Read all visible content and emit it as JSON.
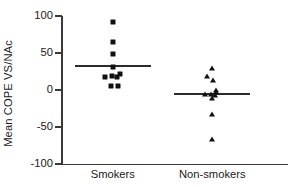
{
  "chart_data": {
    "type": "scatter",
    "title": "",
    "subtitle": "",
    "xlabel": "",
    "ylabel": "Mean COPE VS/NAc",
    "categories": [
      "Smokers",
      "Non-smokers"
    ],
    "ylim": [
      -100,
      100
    ],
    "yticks": [
      100,
      50,
      0,
      -50,
      -100
    ],
    "ytick_labels": [
      "100",
      "50",
      "0",
      "-50",
      "-100"
    ],
    "grid": false,
    "legend": null,
    "legend_position": "none",
    "annotations": [],
    "series": [
      {
        "name": "Smokers",
        "marker": "square",
        "color": "#111111",
        "x_center_frac": 0.225,
        "mean": 33,
        "mean_bar_label": "Smokers mean line",
        "points": [
          {
            "value": 92,
            "offset": 0
          },
          {
            "value": 65,
            "offset": 0
          },
          {
            "value": 48,
            "offset": 0
          },
          {
            "value": 31,
            "offset": 0
          },
          {
            "value": 22,
            "offset": 7
          },
          {
            "value": 19,
            "offset": -1
          },
          {
            "value": 18,
            "offset": -8
          },
          {
            "value": 17,
            "offset": 4
          },
          {
            "value": 6,
            "offset": -2
          },
          {
            "value": 6,
            "offset": 5
          }
        ]
      },
      {
        "name": "Non-smokers",
        "marker": "triangle",
        "color": "#111111",
        "x_center_frac": 0.665,
        "mean": -6,
        "mean_bar_label": "Non-smokers mean line",
        "points": [
          {
            "value": 30,
            "offset": 0
          },
          {
            "value": 19,
            "offset": -5
          },
          {
            "value": 14,
            "offset": 1
          },
          {
            "value": 0,
            "offset": 4
          },
          {
            "value": -3,
            "offset": 4
          },
          {
            "value": -5,
            "offset": -1
          },
          {
            "value": -6,
            "offset": -7
          },
          {
            "value": -7,
            "offset": 3
          },
          {
            "value": -11,
            "offset": 0
          },
          {
            "value": -32,
            "offset": 0
          },
          {
            "value": -66,
            "offset": 0
          }
        ]
      }
    ]
  },
  "axis": {
    "y_label": "Mean COPE VS/NAc",
    "y_ticks": [
      "100",
      "50",
      "0",
      "-50",
      "-100"
    ]
  },
  "groups": [
    {
      "label": "Smokers"
    },
    {
      "label": "Non-smokers"
    }
  ]
}
